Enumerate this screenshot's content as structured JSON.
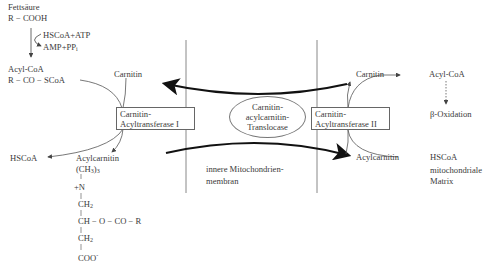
{
  "cytosol": {
    "fatty_acid_label": "Fettsäure",
    "fatty_acid_formula": "R − COOH",
    "activation_inputs": "HSCoA+ATP",
    "activation_outputs": "AMP+PP",
    "activation_outputs_sub": "i",
    "acyl_coa_label": "Acyl-CoA",
    "acyl_coa_formula": "R − CO − SCoA",
    "carnitin_label": "Carnitin",
    "hscoa_label": "HSCoA",
    "acylcarnitin_label": "Acylcarnitin"
  },
  "structure": {
    "line1": "(CH",
    "line1_sub": "3",
    "line1_end": ")",
    "line1_sub2": "3",
    "line2": "+N",
    "line3": "CH",
    "line3_sub": "2",
    "line4": "CH − O − CO − R",
    "line5": "CH",
    "line5_sub": "2",
    "line6": "COO",
    "line6_sup": "-"
  },
  "enzymes": {
    "cat1_line1": "Carnitin-",
    "cat1_line2": "Acyltransferase I",
    "translocase_line1": "Carnitin-",
    "translocase_line2": "acylcarnitin-",
    "translocase_line3": "Translocase",
    "cat2_line1": "Carnitin-",
    "cat2_line2": "Acyltransferase II"
  },
  "membrane": {
    "label_line1": "innere Mitochondrien-",
    "label_line2": "membran"
  },
  "matrix": {
    "carnitin_label": "Carnitin",
    "acyl_coa_label": "Acyl-CoA",
    "beta_oxidation_label": "β-Oxidation",
    "acylcarnitin_label": "Acylcarnitin",
    "hscoa_label": "HSCoA",
    "region_line1": "mitochondriale",
    "region_line2": "Matrix"
  },
  "colors": {
    "line": "#555555",
    "arrow": "#1a1a1a",
    "membrane": "#888888"
  }
}
